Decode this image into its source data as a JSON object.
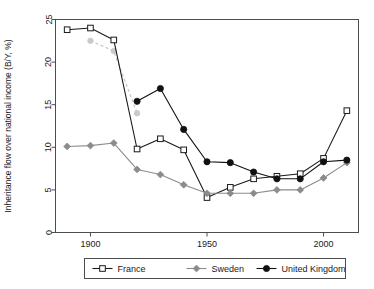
{
  "chart_data": {
    "type": "line",
    "title": "",
    "xlabel": "",
    "ylabel": "Inheritance flow over national income (B/Y, %)",
    "xlim": [
      1885,
      2015
    ],
    "ylim": [
      0,
      25
    ],
    "xticks": [
      1900,
      1950,
      2000
    ],
    "yticks": [
      0,
      5,
      10,
      15,
      20,
      25
    ],
    "grid": false,
    "legend_position": "bottom-outside",
    "series": [
      {
        "name": "France",
        "color": "#1a1a1a",
        "marker": "open-square",
        "linestyle": "solid",
        "x": [
          1890,
          1900,
          1910,
          1920,
          1930,
          1940,
          1950,
          1960,
          1970,
          1980,
          1990,
          2000,
          2010
        ],
        "values": [
          23.8,
          24.0,
          22.6,
          9.8,
          11.0,
          9.7,
          4.1,
          5.3,
          6.3,
          6.6,
          6.9,
          8.7,
          14.3
        ]
      },
      {
        "name": "Sweden",
        "color": "#8c8c8c",
        "marker": "filled-diamond",
        "linestyle": "solid",
        "x": [
          1890,
          1900,
          1910,
          1920,
          1930,
          1940,
          1950,
          1960,
          1970,
          1980,
          1990,
          2000,
          2010
        ],
        "values": [
          10.1,
          10.2,
          10.5,
          7.4,
          6.8,
          5.6,
          4.6,
          4.6,
          4.6,
          5.0,
          5.0,
          6.4,
          8.2
        ]
      },
      {
        "name": "United Kingdom",
        "color": "#111111",
        "marker": "filled-circle",
        "linestyle": "solid",
        "x": [
          1920,
          1930,
          1940,
          1950,
          1960,
          1970,
          1980,
          1990,
          2000,
          2010
        ],
        "values": [
          15.4,
          16.9,
          12.1,
          8.3,
          8.2,
          7.1,
          6.3,
          6.3,
          8.3,
          8.5
        ]
      },
      {
        "name": "Sweden upper (dashed)",
        "color": "#c9c9c9",
        "marker": "filled-circle-light",
        "linestyle": "dashed",
        "x": [
          1900,
          1910,
          1920
        ],
        "values": [
          22.5,
          21.3,
          14.0
        ]
      }
    ],
    "legend": [
      {
        "label": "France",
        "marker": "open-square",
        "color": "#1a1a1a"
      },
      {
        "label": "Sweden",
        "marker": "filled-diamond",
        "color": "#8c8c8c"
      },
      {
        "label": "United Kingdom",
        "marker": "filled-circle",
        "color": "#111111"
      }
    ]
  }
}
